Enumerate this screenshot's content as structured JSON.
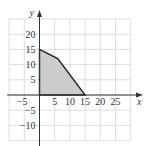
{
  "chart_data": {
    "type": "area",
    "title": "",
    "xlabel": "x",
    "ylabel": "y",
    "xlim": [
      -10,
      30
    ],
    "ylim": [
      -15,
      25
    ],
    "grid": true,
    "grid_step": 5,
    "x_ticks": [
      "-5",
      "5",
      "10",
      "15",
      "20",
      "25"
    ],
    "y_ticks": [
      "20",
      "15",
      "10",
      "5",
      "-5",
      "-10"
    ],
    "region": {
      "description": "Shaded feasible region",
      "vertices": [
        [
          0,
          0
        ],
        [
          0,
          15
        ],
        [
          6,
          12
        ],
        [
          15,
          0
        ]
      ],
      "fill": "#cccccc",
      "stroke": "#222222"
    }
  },
  "axes": {
    "x_label": "x",
    "y_label": "y"
  },
  "ticks": {
    "x": [
      {
        "v": -5,
        "label": "−5"
      },
      {
        "v": 5,
        "label": "5"
      },
      {
        "v": 10,
        "label": "10"
      },
      {
        "v": 15,
        "label": "15"
      },
      {
        "v": 20,
        "label": "20"
      },
      {
        "v": 25,
        "label": "25"
      }
    ],
    "y": [
      {
        "v": 20,
        "label": "20"
      },
      {
        "v": 15,
        "label": "15"
      },
      {
        "v": 10,
        "label": "10"
      },
      {
        "v": 5,
        "label": "5"
      },
      {
        "v": -5,
        "label": "−5"
      },
      {
        "v": -10,
        "label": "−10"
      }
    ]
  }
}
